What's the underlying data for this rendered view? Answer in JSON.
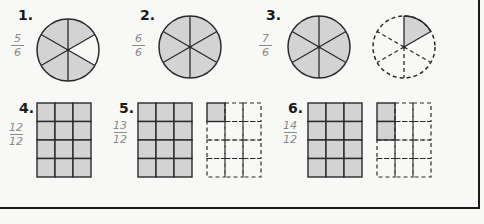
{
  "colors": {
    "shade": "#d3d3d3",
    "line": "#2a2a2a",
    "handwriting": "#8a8a8a",
    "paper": "#f8f8f6"
  },
  "problems": [
    {
      "number": "1.",
      "numerator": "5",
      "denominator": "6",
      "model": "circle",
      "parts": 6,
      "wholes": [
        {
          "shaded": 5,
          "dashed": false
        }
      ]
    },
    {
      "number": "2.",
      "numerator": "6",
      "denominator": "6",
      "model": "circle",
      "parts": 6,
      "wholes": [
        {
          "shaded": 6,
          "dashed": false
        }
      ]
    },
    {
      "number": "3.",
      "numerator": "7",
      "denominator": "6",
      "model": "circle",
      "parts": 6,
      "wholes": [
        {
          "shaded": 6,
          "dashed": false
        },
        {
          "shaded": 1,
          "dashed": true
        }
      ]
    },
    {
      "number": "4.",
      "numerator": "12",
      "denominator": "12",
      "model": "grid",
      "parts": 12,
      "wholes": [
        {
          "shaded": 12,
          "dashed": false
        }
      ]
    },
    {
      "number": "5.",
      "numerator": "13",
      "denominator": "12",
      "model": "grid",
      "parts": 12,
      "wholes": [
        {
          "shaded": 12,
          "dashed": false
        },
        {
          "shaded": 1,
          "dashed": true
        }
      ]
    },
    {
      "number": "6.",
      "numerator": "14",
      "denominator": "12",
      "model": "grid",
      "parts": 12,
      "wholes": [
        {
          "shaded": 12,
          "dashed": false
        },
        {
          "shaded": 2,
          "dashed": true
        }
      ]
    }
  ]
}
